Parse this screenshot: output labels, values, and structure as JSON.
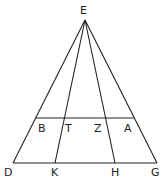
{
  "diagram": {
    "type": "geometry",
    "points": [
      {
        "id": "E",
        "label": "E"
      },
      {
        "id": "B",
        "label": "B"
      },
      {
        "id": "T",
        "label": "T"
      },
      {
        "id": "Z",
        "label": "Z"
      },
      {
        "id": "A",
        "label": "A"
      },
      {
        "id": "D",
        "label": "D"
      },
      {
        "id": "K",
        "label": "K"
      },
      {
        "id": "H",
        "label": "H"
      },
      {
        "id": "G",
        "label": "G"
      }
    ],
    "segments": [
      [
        "E",
        "D"
      ],
      [
        "E",
        "K"
      ],
      [
        "E",
        "H"
      ],
      [
        "E",
        "G"
      ],
      [
        "B",
        "A"
      ],
      [
        "D",
        "G"
      ]
    ]
  }
}
